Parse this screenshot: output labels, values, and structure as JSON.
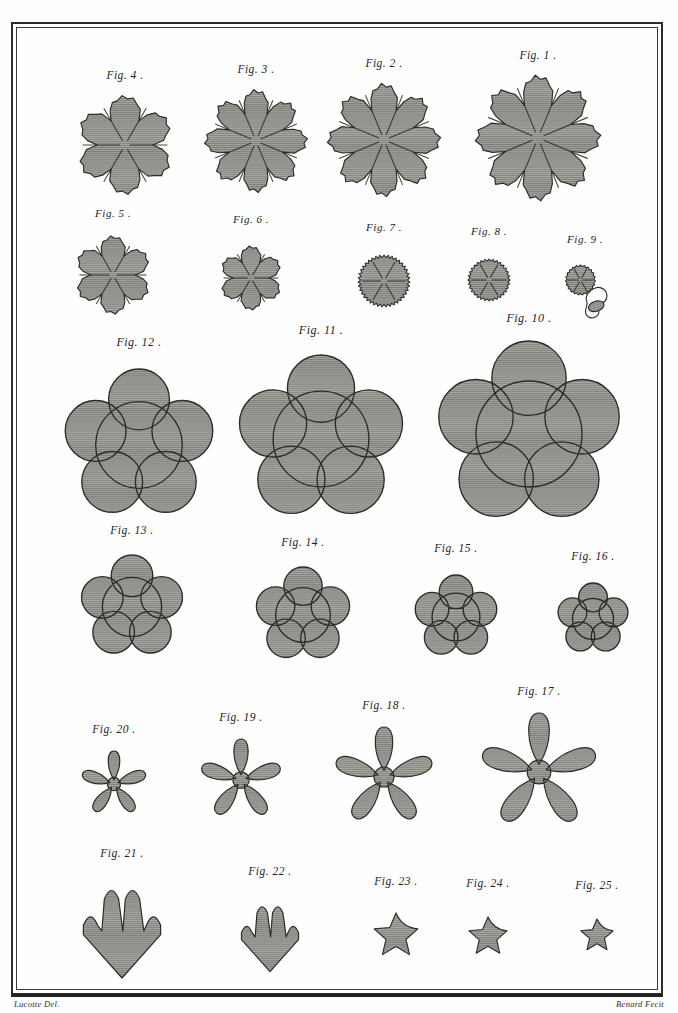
{
  "plate": {
    "medium": "copperplate engraving",
    "paper_color": "#fefefe",
    "ink_color": "#2b2b28",
    "fill_color": "#9a9a95",
    "border": {
      "style": "double-rule",
      "outer_width_px": 2,
      "inner_width_px": 1
    }
  },
  "credits": {
    "designer": "Lucotte Del.",
    "engraver": "Benard Fecit"
  },
  "figures": [
    {
      "id": 4,
      "caption": "Fig. 4 .",
      "shape": "scalloped-rosette",
      "lobes": 6,
      "serrated": true,
      "size": 96,
      "row": 1
    },
    {
      "id": 3,
      "caption": "Fig. 3 .",
      "shape": "scalloped-rosette",
      "lobes": 8,
      "serrated": true,
      "size": 100,
      "row": 1
    },
    {
      "id": 2,
      "caption": "Fig. 2 .",
      "shape": "scalloped-rosette",
      "lobes": 8,
      "serrated": true,
      "size": 110,
      "row": 1
    },
    {
      "id": 1,
      "caption": "Fig. 1 .",
      "shape": "scalloped-rosette",
      "lobes": 8,
      "serrated": true,
      "size": 122,
      "row": 1
    },
    {
      "id": 5,
      "caption": "Fig. 5 .",
      "shape": "scalloped-rosette",
      "lobes": 6,
      "serrated": true,
      "size": 76,
      "row": 2
    },
    {
      "id": 6,
      "caption": "Fig. 6 .",
      "shape": "scalloped-rosette",
      "lobes": 6,
      "serrated": true,
      "size": 62,
      "row": 2
    },
    {
      "id": 7,
      "caption": "Fig. 7 .",
      "shape": "serrated-disc",
      "lobes": 6,
      "serrated": true,
      "size": 52,
      "row": 2
    },
    {
      "id": 8,
      "caption": "Fig. 8 .",
      "shape": "serrated-disc",
      "lobes": 6,
      "serrated": true,
      "size": 42,
      "row": 2
    },
    {
      "id": 9,
      "caption": "Fig. 9 .",
      "shape": "serrated-disc-with-fragments",
      "lobes": 6,
      "serrated": true,
      "size": 30,
      "row": 2
    },
    {
      "id": 12,
      "caption": "Fig. 12 .",
      "shape": "cinquefoil",
      "lobes": 5,
      "serrated": false,
      "size": 152,
      "row": 3
    },
    {
      "id": 11,
      "caption": "Fig. 11 .",
      "shape": "cinquefoil",
      "lobes": 5,
      "serrated": false,
      "size": 168,
      "row": 3
    },
    {
      "id": 10,
      "caption": "Fig. 10 .",
      "shape": "cinquefoil",
      "lobes": 5,
      "serrated": false,
      "size": 186,
      "row": 3
    },
    {
      "id": 13,
      "caption": "Fig. 13 .",
      "shape": "cinquefoil",
      "lobes": 5,
      "serrated": false,
      "size": 104,
      "row": 4
    },
    {
      "id": 14,
      "caption": "Fig. 14 .",
      "shape": "cinquefoil",
      "lobes": 5,
      "serrated": false,
      "size": 96,
      "row": 4
    },
    {
      "id": 15,
      "caption": "Fig. 15 .",
      "shape": "cinquefoil",
      "lobes": 5,
      "serrated": false,
      "size": 84,
      "row": 4
    },
    {
      "id": 16,
      "caption": "Fig. 16 .",
      "shape": "cinquefoil",
      "lobes": 5,
      "serrated": false,
      "size": 72,
      "row": 4
    },
    {
      "id": 20,
      "caption": "Fig. 20 .",
      "shape": "petal-flower",
      "lobes": 5,
      "serrated": false,
      "size": 66,
      "row": 5
    },
    {
      "id": 19,
      "caption": "Fig. 19 .",
      "shape": "petal-flower",
      "lobes": 5,
      "serrated": false,
      "size": 82,
      "row": 5
    },
    {
      "id": 18,
      "caption": "Fig. 18 .",
      "shape": "petal-flower",
      "lobes": 5,
      "serrated": false,
      "size": 100,
      "row": 5
    },
    {
      "id": 17,
      "caption": "Fig. 17 .",
      "shape": "petal-flower",
      "lobes": 5,
      "serrated": false,
      "size": 118,
      "row": 5
    },
    {
      "id": 21,
      "caption": "Fig. 21 .",
      "shape": "palmate-leaf",
      "lobes": 4,
      "serrated": false,
      "size": 84,
      "row": 6
    },
    {
      "id": 22,
      "caption": "Fig. 22 .",
      "shape": "palmate-leaf",
      "lobes": 4,
      "serrated": false,
      "size": 62,
      "row": 6
    },
    {
      "id": 23,
      "caption": "Fig. 23 .",
      "shape": "star-flower",
      "lobes": 5,
      "serrated": false,
      "size": 46,
      "row": 6
    },
    {
      "id": 24,
      "caption": "Fig. 24 .",
      "shape": "star-flower",
      "lobes": 5,
      "serrated": false,
      "size": 40,
      "row": 6
    },
    {
      "id": 25,
      "caption": "Fig. 25 .",
      "shape": "star-flower",
      "lobes": 5,
      "serrated": false,
      "size": 34,
      "row": 6
    }
  ]
}
